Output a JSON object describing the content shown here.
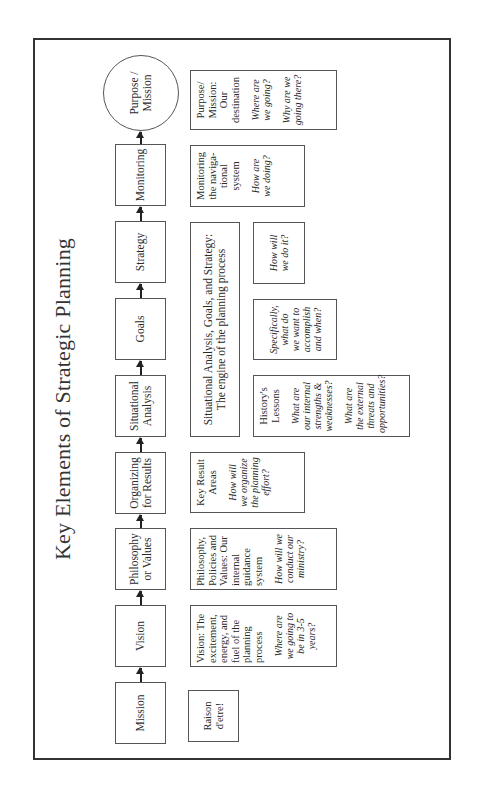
{
  "title": "Key Elements of Strategic Planning",
  "flow": {
    "steps": [
      {
        "label": "Mission"
      },
      {
        "label": "Vision"
      },
      {
        "label": "Philosophy\nor Values"
      },
      {
        "label": "Organizing\nfor Results"
      },
      {
        "label": "Situational\nAnalysis"
      },
      {
        "label": "Goals"
      },
      {
        "label": "Strategy"
      },
      {
        "label": "Monitoring"
      }
    ],
    "end": {
      "label": "Purpose /\nMission",
      "shape": "circle"
    }
  },
  "descriptions": {
    "mission": {
      "main": "Raison\nd'etre!"
    },
    "vision": {
      "main": "Vision: The\nexcitement,\nenergy, and\nfuel of the\nplanning\nprocess",
      "question": "Where are\nwe going to\nbe in 3-5\nyears?"
    },
    "philosophy": {
      "main": "Philosophy,\nPolicies and\nValues: Our\ninternal\nguidance\nsystem",
      "question": "How will we\nconduct our\nministry?"
    },
    "organizing": {
      "main": "Key Result\nAreas",
      "question": "How will\nwe organize\nthe planning\neffort?"
    },
    "engine": {
      "main": "Situational Analysis, Goals, and Strategy:\nThe engine of the planning process"
    },
    "situational": {
      "main": "History's\nLessons",
      "question1": "What are\nour internal\nstrengths &\nweaknesses?",
      "question2": "What are\nthe external\nthreats and\nopportunities?"
    },
    "goals": {
      "question": "Specifically,\nwhat do\nwe want to\naccomplish\nand when?"
    },
    "strategy": {
      "question": "How will\nwe do it?"
    },
    "monitoring": {
      "main": "Monitoring\nthe naviga-\ntional\nsystem",
      "question": "How are\nwe doing?"
    },
    "purpose": {
      "main": "Purpose/\nMission:\nOur\ndestination",
      "question1": "Where are\nwe going?",
      "question2": "Why are we\ngoing there?"
    }
  },
  "orientation": "rotated -90deg (reads bottom-to-top)"
}
